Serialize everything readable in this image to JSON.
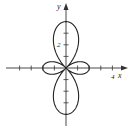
{
  "chart_data": {
    "type": "line",
    "subtype": "polar-curve",
    "title": "",
    "equation": "r = 1 - 3cos(2θ)",
    "xlabel": "x",
    "ylabel": "y",
    "xlim": [
      -5,
      5
    ],
    "ylim": [
      -5,
      5
    ],
    "x_tick_values": [
      -4,
      -3,
      -2,
      -1,
      1,
      2,
      3,
      4
    ],
    "y_tick_values": [
      -3,
      -2,
      -1,
      1,
      2,
      3
    ],
    "x_tick_labels": [
      {
        "value": 4,
        "label": "4"
      }
    ],
    "y_tick_labels": [
      {
        "value": 2,
        "label": "2"
      }
    ],
    "grid": false,
    "legend": null,
    "features": {
      "upper_lobe_max_y": 4,
      "lower_lobe_min_y": -4,
      "right_lobe_max_x": 2,
      "left_lobe_min_x": -2
    },
    "colors": {
      "curve": "#222222",
      "axes": "#333333"
    }
  },
  "axes": {
    "x_label": "x",
    "y_label": "y",
    "x_tick_label": "4",
    "y_tick_label": "2"
  }
}
